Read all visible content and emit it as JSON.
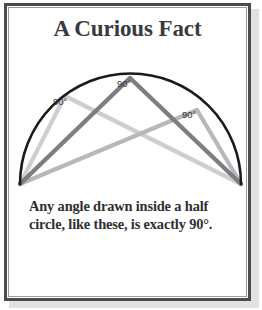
{
  "card": {
    "title": "A Curious Fact",
    "caption": "Any angle drawn inside a half circle, like these, is exactly 90°."
  },
  "figure": {
    "name": "thales-half-circle-diagram",
    "arc_color": "#1b1b1b",
    "triangle_colors": {
      "dark_gray": "#7d7d82",
      "mid_gray": "#a8a8ad",
      "light_gray": "#cfcfd3"
    },
    "diameter": {
      "left_endpoint": [
        13,
        131
      ],
      "right_endpoint": [
        234,
        131
      ]
    },
    "labels": [
      {
        "text": "90°",
        "x": 46,
        "y": 52
      },
      {
        "text": "90°",
        "x": 110,
        "y": 34
      },
      {
        "text": "90°",
        "x": 175,
        "y": 65
      }
    ],
    "triangles": [
      {
        "name": "left-triangle",
        "apex": [
          58,
          43
        ],
        "color": "#cfcfd3"
      },
      {
        "name": "center-triangle",
        "apex": [
          123,
          25
        ],
        "color": "#7d7d82"
      },
      {
        "name": "right-triangle",
        "apex": [
          190,
          57
        ],
        "color": "#b7b7bc"
      }
    ]
  },
  "frame": {
    "border_color": "#4a4a4f",
    "inner_rule_color": "#9a9a9e",
    "background": "#ffffff"
  }
}
